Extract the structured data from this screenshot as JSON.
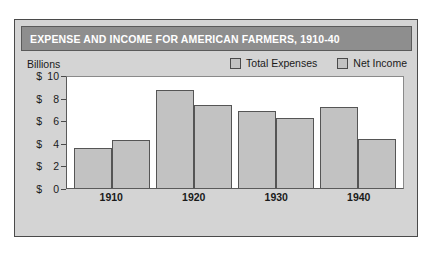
{
  "chart_data": {
    "type": "bar",
    "title": "EXPENSE AND INCOME FOR AMERICAN FARMERS, 1910-40",
    "xlabel": "",
    "ylabel": "Billions",
    "ylim": [
      0,
      10
    ],
    "yticks": [
      {
        "dollar": "$",
        "num": "10"
      },
      {
        "dollar": "$",
        "num": "8"
      },
      {
        "dollar": "$",
        "num": "6"
      },
      {
        "dollar": "$",
        "num": "4"
      },
      {
        "dollar": "$",
        "num": "2"
      },
      {
        "dollar": "$",
        "num": "0"
      }
    ],
    "grid": false,
    "legend_position": "top-right",
    "categories": [
      "1910",
      "1920",
      "1930",
      "1940"
    ],
    "series": [
      {
        "name": "Total Expenses",
        "color": "#c2c2c2",
        "values": [
          3.6,
          8.8,
          6.9,
          7.3
        ]
      },
      {
        "name": "Net Income",
        "color": "#c2c2c2",
        "values": [
          4.3,
          7.5,
          6.3,
          4.4
        ]
      }
    ]
  },
  "colors": {
    "title_bar": "#8e8e8e",
    "title_text": "#ffffff",
    "panel": "#d4d4d4",
    "bar_fill": "#c2c2c2",
    "bar_stroke": "#555555",
    "plot_bg": "#ffffff"
  }
}
